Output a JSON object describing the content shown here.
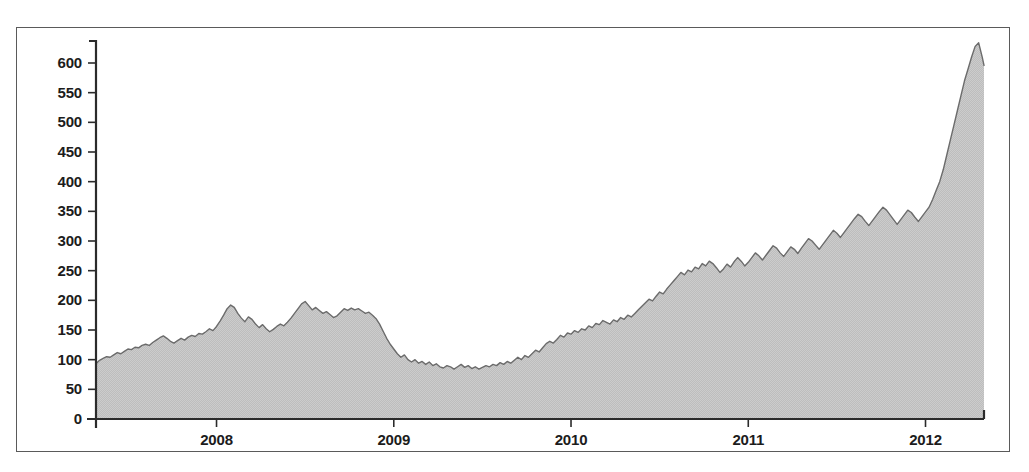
{
  "chart_data": {
    "type": "area",
    "title": "",
    "xlabel": "",
    "ylabel": "",
    "grid": false,
    "legend": null,
    "xlim": [
      2007.32,
      2012.33
    ],
    "ylim": [
      0,
      640
    ],
    "y_ticks": [
      0,
      50,
      100,
      150,
      200,
      250,
      300,
      350,
      400,
      450,
      500,
      550,
      600
    ],
    "y_tick_labels": [
      "0",
      "50",
      "100",
      "150",
      "200",
      "250",
      "300",
      "350",
      "400",
      "450",
      "500",
      "550",
      "600"
    ],
    "x_ticks": [
      2008,
      2009,
      2010,
      2011,
      2012
    ],
    "x_tick_labels": [
      "2008",
      "2009",
      "2010",
      "2011",
      "2012"
    ],
    "series": [
      {
        "name": "price",
        "fill_color": "#c9c9c9",
        "line_color": "#6b6b6b",
        "x": [
          2007.32,
          2007.34,
          2007.36,
          2007.38,
          2007.4,
          2007.42,
          2007.44,
          2007.46,
          2007.48,
          2007.5,
          2007.52,
          2007.54,
          2007.56,
          2007.58,
          2007.6,
          2007.62,
          2007.64,
          2007.66,
          2007.68,
          2007.7,
          2007.72,
          2007.74,
          2007.76,
          2007.78,
          2007.8,
          2007.82,
          2007.84,
          2007.86,
          2007.88,
          2007.9,
          2007.92,
          2007.94,
          2007.96,
          2007.98,
          2008.0,
          2008.02,
          2008.04,
          2008.06,
          2008.08,
          2008.1,
          2008.12,
          2008.14,
          2008.16,
          2008.18,
          2008.2,
          2008.22,
          2008.24,
          2008.26,
          2008.28,
          2008.3,
          2008.32,
          2008.34,
          2008.36,
          2008.38,
          2008.4,
          2008.42,
          2008.44,
          2008.46,
          2008.48,
          2008.5,
          2008.52,
          2008.54,
          2008.56,
          2008.58,
          2008.6,
          2008.62,
          2008.64,
          2008.66,
          2008.68,
          2008.7,
          2008.72,
          2008.74,
          2008.76,
          2008.78,
          2008.8,
          2008.82,
          2008.84,
          2008.86,
          2008.88,
          2008.9,
          2008.92,
          2008.94,
          2008.96,
          2008.98,
          2009.0,
          2009.02,
          2009.04,
          2009.06,
          2009.08,
          2009.1,
          2009.12,
          2009.14,
          2009.16,
          2009.18,
          2009.2,
          2009.22,
          2009.24,
          2009.26,
          2009.28,
          2009.3,
          2009.32,
          2009.34,
          2009.36,
          2009.38,
          2009.4,
          2009.42,
          2009.44,
          2009.46,
          2009.48,
          2009.5,
          2009.52,
          2009.54,
          2009.56,
          2009.58,
          2009.6,
          2009.62,
          2009.64,
          2009.66,
          2009.68,
          2009.7,
          2009.72,
          2009.74,
          2009.76,
          2009.78,
          2009.8,
          2009.82,
          2009.84,
          2009.86,
          2009.88,
          2009.9,
          2009.92,
          2009.94,
          2009.96,
          2009.98,
          2010.0,
          2010.02,
          2010.04,
          2010.06,
          2010.08,
          2010.1,
          2010.12,
          2010.14,
          2010.16,
          2010.18,
          2010.2,
          2010.22,
          2010.24,
          2010.26,
          2010.28,
          2010.3,
          2010.32,
          2010.34,
          2010.36,
          2010.38,
          2010.4,
          2010.42,
          2010.44,
          2010.46,
          2010.48,
          2010.5,
          2010.52,
          2010.54,
          2010.56,
          2010.58,
          2010.6,
          2010.62,
          2010.64,
          2010.66,
          2010.68,
          2010.7,
          2010.72,
          2010.74,
          2010.76,
          2010.78,
          2010.8,
          2010.82,
          2010.84,
          2010.86,
          2010.88,
          2010.9,
          2010.92,
          2010.94,
          2010.96,
          2010.98,
          2011.0,
          2011.02,
          2011.04,
          2011.06,
          2011.08,
          2011.1,
          2011.12,
          2011.14,
          2011.16,
          2011.18,
          2011.2,
          2011.22,
          2011.24,
          2011.26,
          2011.28,
          2011.3,
          2011.32,
          2011.34,
          2011.36,
          2011.38,
          2011.4,
          2011.42,
          2011.44,
          2011.46,
          2011.48,
          2011.5,
          2011.52,
          2011.54,
          2011.56,
          2011.58,
          2011.6,
          2011.62,
          2011.64,
          2011.66,
          2011.68,
          2011.7,
          2011.72,
          2011.74,
          2011.76,
          2011.78,
          2011.8,
          2011.82,
          2011.84,
          2011.86,
          2011.88,
          2011.9,
          2011.92,
          2011.94,
          2011.96,
          2011.98,
          2012.0,
          2012.02,
          2012.04,
          2012.06,
          2012.08,
          2012.1,
          2012.12,
          2012.14,
          2012.16,
          2012.18,
          2012.2,
          2012.22,
          2012.24,
          2012.26,
          2012.28,
          2012.3,
          2012.32,
          2012.33
        ],
        "y": [
          93,
          99,
          102,
          105,
          104,
          108,
          112,
          110,
          114,
          118,
          117,
          121,
          120,
          124,
          126,
          124,
          129,
          133,
          137,
          140,
          136,
          131,
          128,
          132,
          136,
          133,
          138,
          141,
          139,
          144,
          143,
          147,
          152,
          149,
          156,
          165,
          175,
          186,
          192,
          188,
          178,
          170,
          164,
          172,
          168,
          160,
          154,
          159,
          152,
          147,
          151,
          156,
          160,
          157,
          163,
          170,
          178,
          186,
          194,
          198,
          191,
          184,
          188,
          183,
          178,
          181,
          176,
          171,
          174,
          180,
          186,
          183,
          187,
          184,
          186,
          182,
          178,
          180,
          175,
          169,
          160,
          148,
          136,
          126,
          118,
          110,
          104,
          108,
          100,
          96,
          100,
          94,
          97,
          92,
          96,
          90,
          93,
          88,
          86,
          90,
          88,
          84,
          88,
          92,
          87,
          90,
          85,
          88,
          84,
          87,
          90,
          88,
          92,
          90,
          95,
          92,
          97,
          94,
          99,
          104,
          100,
          107,
          104,
          110,
          116,
          113,
          120,
          127,
          131,
          128,
          134,
          141,
          138,
          145,
          143,
          149,
          146,
          152,
          150,
          157,
          154,
          161,
          159,
          166,
          163,
          160,
          167,
          164,
          171,
          168,
          175,
          172,
          178,
          184,
          190,
          196,
          202,
          199,
          207,
          214,
          211,
          219,
          226,
          233,
          240,
          247,
          243,
          251,
          248,
          256,
          253,
          262,
          258,
          266,
          262,
          255,
          247,
          253,
          261,
          256,
          265,
          272,
          266,
          258,
          264,
          272,
          280,
          275,
          268,
          276,
          284,
          292,
          288,
          280,
          274,
          282,
          290,
          286,
          279,
          288,
          296,
          304,
          300,
          293,
          286,
          294,
          302,
          310,
          318,
          313,
          306,
          314,
          322,
          330,
          338,
          345,
          341,
          333,
          326,
          334,
          342,
          350,
          357,
          352,
          344,
          336,
          328,
          336,
          344,
          352,
          348,
          340,
          333,
          341,
          349,
          357,
          370,
          385,
          400,
          420,
          445,
          470,
          495,
          520,
          545,
          570,
          590,
          610,
          628,
          634,
          610,
          596
        ]
      }
    ]
  },
  "axis": {
    "y_tick_labels": [
      "600",
      "550",
      "500",
      "450",
      "400",
      "350",
      "300",
      "250",
      "200",
      "150",
      "100",
      "50",
      "0"
    ],
    "x_tick_labels": [
      "2008",
      "2009",
      "2010",
      "2011",
      "2012"
    ]
  },
  "colors": {
    "frame": "#5a5a5a",
    "axis": "#2b2b2b",
    "fill": "#c9c9c9",
    "line": "#6b6b6b",
    "text": "#1c1c1c",
    "background": "#ffffff"
  }
}
